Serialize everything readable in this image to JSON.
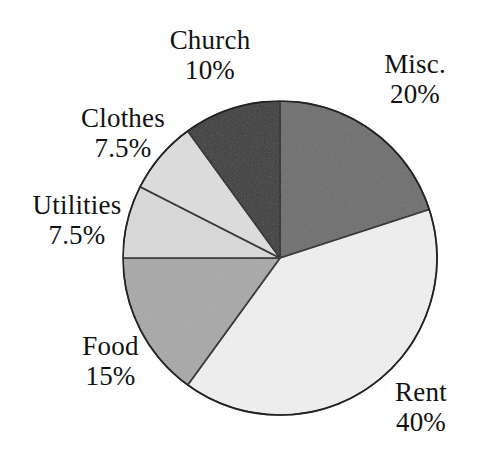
{
  "chart_data": {
    "type": "pie",
    "title": "",
    "subtitle": "",
    "xlabel": "",
    "ylabel": "",
    "legend_position": "none",
    "grid": false,
    "value_unit": "%",
    "start_angle_deg": 0,
    "direction": "clockwise",
    "categories": [
      "Misc.",
      "Rent",
      "Food",
      "Utilities",
      "Clothes",
      "Church"
    ],
    "values": [
      20,
      40,
      15,
      7.5,
      7.5,
      10
    ],
    "slices": [
      {
        "name": "Misc.",
        "value": 20,
        "value_label": "20%",
        "color": "#6e6e6e",
        "start_deg": 0,
        "end_deg": 72
      },
      {
        "name": "Rent",
        "value": 40,
        "value_label": "40%",
        "color": "#efefef",
        "start_deg": 72,
        "end_deg": 216
      },
      {
        "name": "Food",
        "value": 15,
        "value_label": "15%",
        "color": "#a8a8a8",
        "start_deg": 216,
        "end_deg": 270
      },
      {
        "name": "Utilities",
        "value": 7.5,
        "value_label": "7.5%",
        "color": "#d9d9d9",
        "start_deg": 270,
        "end_deg": 297
      },
      {
        "name": "Clothes",
        "value": 7.5,
        "value_label": "7.5%",
        "color": "#dddddd",
        "start_deg": 297,
        "end_deg": 324
      },
      {
        "name": "Church",
        "value": 10,
        "value_label": "10%",
        "color": "#3b3b3b",
        "start_deg": 324,
        "end_deg": 360
      }
    ],
    "geometry": {
      "center_x": 280,
      "center_y": 258,
      "radius": 157,
      "outline_color": "#222222"
    }
  },
  "labels": {
    "church": {
      "name": "Church",
      "pct": "10%"
    },
    "misc": {
      "name": "Misc.",
      "pct": "20%"
    },
    "clothes": {
      "name": "Clothes",
      "pct": "7.5%"
    },
    "utilities": {
      "name": "Utilities",
      "pct": "7.5%"
    },
    "food": {
      "name": "Food",
      "pct": "15%"
    },
    "rent": {
      "name": "Rent",
      "pct": "40%"
    }
  }
}
